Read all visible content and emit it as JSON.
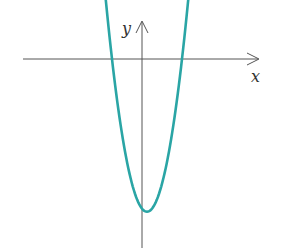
{
  "chart_data": {
    "type": "line",
    "title": "",
    "xlabel": "x",
    "ylabel": "y",
    "series": [
      {
        "name": "parabola",
        "color": "#2aa5a5",
        "x": [
          -1.95,
          -1.5,
          -1.0,
          -0.5,
          0.0,
          0.25,
          0.5,
          1.0,
          1.5,
          2.0,
          2.45
        ],
        "y": [
          1.0,
          -0.15,
          -1.45,
          -2.45,
          -3.05,
          -3.15,
          -3.1,
          -2.6,
          -1.65,
          -0.3,
          1.0
        ]
      }
    ],
    "x_intercepts": [
      -1.5,
      2.0
    ],
    "vertex": [
      0.25,
      -3.15
    ],
    "grid": false,
    "legend": null,
    "ticks": "none"
  },
  "axes": {
    "x_label": "x",
    "y_label": "y"
  },
  "colors": {
    "curve": "#2aa5a5",
    "axis": "#555555"
  }
}
